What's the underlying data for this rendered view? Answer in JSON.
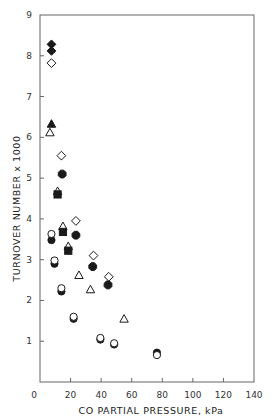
{
  "chart_data": {
    "type": "scatter",
    "title": "",
    "xlabel": "CO PARTIAL PRESSURE, kPa",
    "ylabel": "TURNOVER NUMBER x 1000",
    "xlim": [
      0,
      140
    ],
    "ylim": [
      0,
      9
    ],
    "xticks": [
      0,
      20,
      40,
      60,
      80,
      100,
      120,
      140
    ],
    "yticks": [
      1,
      2,
      3,
      4,
      5,
      6,
      7,
      8,
      9
    ],
    "xtick_labels": [
      "0",
      "20",
      "40",
      "60",
      "80",
      "100",
      "120",
      "140"
    ],
    "ytick_labels": [
      "1",
      "2",
      "3",
      "4",
      "5",
      "6",
      "7",
      "8",
      "9"
    ],
    "grid": false,
    "legend": "none",
    "series": [
      {
        "name": "filled diamond",
        "marker": "diamond",
        "fill": "filled",
        "points": [
          [
            7.5,
            8.28
          ],
          [
            7.5,
            8.12
          ]
        ]
      },
      {
        "name": "open diamond",
        "marker": "diamond",
        "fill": "open",
        "points": [
          [
            7.5,
            7.82
          ],
          [
            14.0,
            5.55
          ],
          [
            23.5,
            3.95
          ],
          [
            35.0,
            3.1
          ],
          [
            45.0,
            2.58
          ]
        ]
      },
      {
        "name": "filled octagon",
        "marker": "octagon",
        "fill": "filled",
        "points": [
          [
            14.5,
            5.1
          ],
          [
            23.5,
            3.6
          ],
          [
            34.5,
            2.83
          ],
          [
            44.5,
            2.38
          ]
        ]
      },
      {
        "name": "filled triangle",
        "marker": "triangle",
        "fill": "filled",
        "points": [
          [
            7.5,
            6.33
          ]
        ]
      },
      {
        "name": "open triangle",
        "marker": "triangle",
        "fill": "open",
        "points": [
          [
            6.5,
            6.12
          ],
          [
            11.5,
            4.68
          ],
          [
            15.0,
            3.82
          ],
          [
            18.5,
            3.33
          ],
          [
            25.5,
            2.62
          ],
          [
            33.0,
            2.27
          ],
          [
            55.0,
            1.55
          ]
        ]
      },
      {
        "name": "filled square",
        "marker": "square",
        "fill": "filled",
        "points": [
          [
            11.5,
            4.6
          ],
          [
            15.0,
            3.68
          ],
          [
            18.5,
            3.22
          ]
        ]
      },
      {
        "name": "filled circle",
        "marker": "circle",
        "fill": "filled",
        "points": [
          [
            7.5,
            3.48
          ],
          [
            9.5,
            2.9
          ],
          [
            14.0,
            2.22
          ],
          [
            22.0,
            1.55
          ],
          [
            39.5,
            1.04
          ],
          [
            48.5,
            0.92
          ],
          [
            76.5,
            0.72
          ]
        ]
      },
      {
        "name": "open circle",
        "marker": "circle",
        "fill": "open",
        "points": [
          [
            7.5,
            3.63
          ],
          [
            9.5,
            2.98
          ],
          [
            14.0,
            2.3
          ],
          [
            22.0,
            1.6
          ],
          [
            39.5,
            1.08
          ],
          [
            48.5,
            0.95
          ],
          [
            76.5,
            0.66
          ]
        ]
      }
    ],
    "colors": {
      "ink": "#1a1a1a",
      "axis": "#555555",
      "background": "#ffffff"
    }
  }
}
